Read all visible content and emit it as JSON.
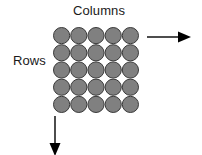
{
  "figure": {
    "background_color": "#ffffff",
    "width": 202,
    "height": 155
  },
  "labels": {
    "columns": "Columns",
    "rows": "Rows",
    "text_color": "#1a1a1a",
    "font_size_px": 13
  },
  "grid": {
    "rows": 5,
    "columns": 5,
    "total_spheres": 25,
    "sphere_diameter_px": 17.2,
    "sphere_fill_color": "#808080",
    "sphere_stroke_color": "#3a3a3a",
    "sphere_stroke_width_px": 1,
    "packing": "touching",
    "origin_x_px": 53,
    "origin_y_px": 27,
    "extent_px": 86
  },
  "arrows": {
    "right": {
      "name": "column-direction-arrow",
      "direction": "right",
      "color": "#000000",
      "length_px": 44,
      "shaft_width_px": 1.4,
      "head_length_px": 12,
      "head_width_px": 11
    },
    "down": {
      "name": "row-direction-arrow",
      "direction": "down",
      "color": "#000000",
      "length_px": 38,
      "shaft_width_px": 1.4,
      "head_length_px": 12,
      "head_width_px": 11
    }
  }
}
